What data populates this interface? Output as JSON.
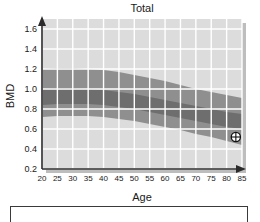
{
  "chart_data": {
    "type": "area",
    "title": "Total",
    "xlabel": "Age",
    "ylabel": "BMD",
    "xlim": [
      20,
      85
    ],
    "ylim": [
      0.2,
      1.7
    ],
    "grid": true,
    "legend": "none",
    "x_ticks": [
      20,
      25,
      30,
      35,
      40,
      45,
      50,
      55,
      60,
      65,
      70,
      75,
      80,
      85
    ],
    "x_tick_labels": [
      "20",
      "25",
      "30",
      "35",
      "40",
      "45",
      "50",
      "55",
      "60",
      "65",
      "70",
      "75",
      "80",
      "85"
    ],
    "y_ticks": [
      0.2,
      0.4,
      0.6,
      0.8,
      1.0,
      1.2,
      1.4,
      1.6
    ],
    "y_tick_labels": [
      "0.2",
      "0.4",
      "0.6",
      "0.8",
      "1.0",
      "1.2",
      "1.4",
      "1.6"
    ],
    "x": [
      20,
      25,
      30,
      35,
      40,
      45,
      50,
      55,
      60,
      65,
      70,
      75,
      80,
      85
    ],
    "series": [
      {
        "name": "outer-reference-band-upper",
        "values": [
          1.2,
          1.21,
          1.21,
          1.2,
          1.19,
          1.17,
          1.14,
          1.11,
          1.08,
          1.04,
          1.0,
          0.97,
          0.94,
          0.91
        ]
      },
      {
        "name": "inner-reference-band-upper",
        "values": [
          1.0,
          1.01,
          1.01,
          1.0,
          0.99,
          0.97,
          0.95,
          0.92,
          0.89,
          0.86,
          0.83,
          0.8,
          0.77,
          0.75
        ]
      },
      {
        "name": "inner-reference-band-lower",
        "values": [
          0.84,
          0.85,
          0.85,
          0.85,
          0.84,
          0.82,
          0.8,
          0.77,
          0.74,
          0.71,
          0.68,
          0.65,
          0.62,
          0.6
        ]
      },
      {
        "name": "outer-reference-band-lower",
        "values": [
          0.72,
          0.73,
          0.73,
          0.73,
          0.72,
          0.7,
          0.68,
          0.65,
          0.62,
          0.59,
          0.55,
          0.52,
          0.48,
          0.44
        ]
      }
    ],
    "annotations": [
      {
        "name": "patient-measurement-marker",
        "symbol": "crosshair-circle",
        "x": 83,
        "y": 0.52
      }
    ],
    "colors": {
      "plot_background": "#dcdcdc",
      "gridline": "#ffffff",
      "outer_band": "#8f8f8f",
      "inner_band": "#6e6e6e",
      "axis": "#2b2b2b",
      "text": "#1a1a1a",
      "marker": "#111111"
    }
  }
}
